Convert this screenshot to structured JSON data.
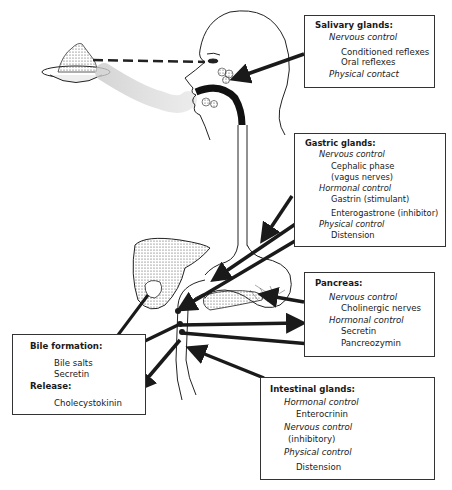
{
  "diagram": {
    "illustration_labels": [
      "food-plate",
      "head-profile",
      "salivary-gland",
      "esophagus",
      "stomach",
      "liver",
      "gallbladder",
      "pancreas",
      "duodenum"
    ]
  },
  "boxes": {
    "salivary": {
      "title": "Salivary glands:",
      "nervous_label": "Nervous control",
      "nervous_items": [
        "Conditioned reflexes",
        "Oral reflexes"
      ],
      "physical_label": "Physical contact"
    },
    "gastric": {
      "title": "Gastric glands:",
      "nervous_label": "Nervous control",
      "nervous_items": [
        "Cephalic phase",
        "(vagus nerves)"
      ],
      "hormonal_label": "Hormonal control",
      "hormonal_items": [
        "Gastrin (stimulant)",
        "Enterogastrone (inhibitor)"
      ],
      "physical_label": "Physical control",
      "physical_items": [
        "Distension"
      ]
    },
    "pancreas": {
      "title": "Pancreas:",
      "nervous_label": "Nervous control",
      "nervous_items": [
        "Cholinergic nerves"
      ],
      "hormonal_label": "Hormonal control",
      "hormonal_items": [
        "Secretin",
        "Pancreozymin"
      ]
    },
    "intestinal": {
      "title": "Intestinal glands:",
      "hormonal_label": "Hormonal control",
      "hormonal_items": [
        "Enterocrinin"
      ],
      "nervous_label": "Nervous control",
      "nervous_items": [
        "(inhibitory)"
      ],
      "physical_label": "Physical control",
      "physical_items": [
        "Distension"
      ]
    },
    "bile": {
      "title": "Bile formation:",
      "items": [
        "Bile salts",
        "Secretin"
      ],
      "release_label": "Release:",
      "release_items": [
        "Cholecystokinin"
      ]
    }
  }
}
